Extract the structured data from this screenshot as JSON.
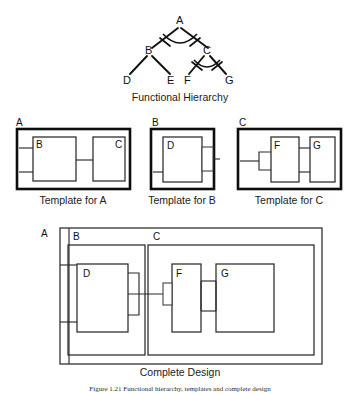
{
  "figure": {
    "caption": "Figure 1.21  Functional hierarchy, templates and complete design"
  },
  "hierarchy": {
    "caption": "Functional Hierarchy",
    "nodes": {
      "root": "A",
      "b": "B",
      "c": "C",
      "d": "D",
      "e": "E",
      "f": "F",
      "g": "G"
    },
    "edges": [
      {
        "from": "A",
        "to": "B"
      },
      {
        "from": "A",
        "to": "C"
      },
      {
        "from": "B",
        "to": "D"
      },
      {
        "from": "B",
        "to": "E"
      },
      {
        "from": "C",
        "to": "F"
      },
      {
        "from": "C",
        "to": "G"
      }
    ],
    "arc_nodes": [
      "A",
      "C"
    ]
  },
  "templates": [
    {
      "id": "template-a",
      "outer_label": "A",
      "caption": "Template for A",
      "blocks": [
        "B",
        "C"
      ]
    },
    {
      "id": "template-b",
      "outer_label": "B",
      "caption": "Template for B",
      "blocks": [
        "D"
      ]
    },
    {
      "id": "template-c",
      "outer_label": "C",
      "caption": "Template for C",
      "blocks": [
        "F",
        "G"
      ]
    }
  ],
  "complete_design": {
    "caption": "Complete Design",
    "outer_label": "A",
    "region_labels": [
      "B",
      "C"
    ],
    "blocks": [
      "D",
      "F",
      "G"
    ]
  },
  "colors": {
    "ink": "#111111",
    "line": "#2a2a2a",
    "background": "#ffffff"
  }
}
